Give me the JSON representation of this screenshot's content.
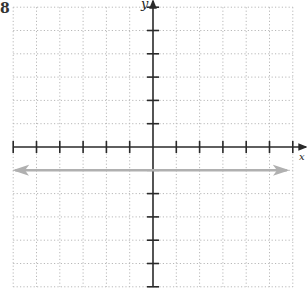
{
  "figure": {
    "corner_label": "8",
    "x_axis_label": "x",
    "y_axis_label": "y"
  },
  "colors": {
    "axis": "#2a2a2a",
    "grid": "#b8b8b8",
    "line": "#b0b0b0"
  },
  "chart_data": {
    "type": "line",
    "title": "",
    "xlabel": "x",
    "ylabel": "y",
    "xlim": [
      -6,
      6
    ],
    "ylim": [
      -6,
      6
    ],
    "grid": true,
    "grid_style": "dotted",
    "x_ticks": [
      -6,
      -5,
      -4,
      -3,
      -2,
      -1,
      1,
      2,
      3,
      4,
      5,
      6
    ],
    "y_ticks": [
      -6,
      -5,
      -4,
      -3,
      -2,
      -1,
      1,
      2,
      3,
      4,
      5,
      6
    ],
    "tick_labels_shown": false,
    "series": [
      {
        "name": "y = -1",
        "equation": "y = -1",
        "x": [
          -6,
          6
        ],
        "y": [
          -1,
          -1
        ],
        "arrows": "both",
        "color": "#b0b0b0"
      }
    ],
    "legend": null
  }
}
